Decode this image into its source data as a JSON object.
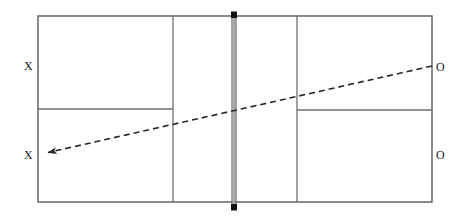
{
  "diagram": {
    "type": "tennis-court-overhead",
    "background_color": "#ffffff",
    "line_color": "#6e6e6e",
    "net_color": "#9a9a9a",
    "net_post_color": "#1a1a1a",
    "shot_color": "#262626",
    "label_color": "#1a1a1a"
  },
  "court": {
    "outer_boundary": {
      "x": 38,
      "y": 16,
      "width": 394,
      "height": 186
    },
    "service_line_left_x": 173,
    "service_line_right_x": 297,
    "center_service_line_left": {
      "x1": 38,
      "y1": 109,
      "x2": 173,
      "y2": 109
    },
    "center_service_line_right": {
      "x1": 297,
      "y1": 110,
      "x2": 432,
      "y2": 110
    },
    "net": {
      "x": 234,
      "y_top": 12,
      "y_bottom": 210,
      "width": 5
    },
    "net_post_top": {
      "x": 234,
      "y": 15
    },
    "net_post_bottom": {
      "x": 234,
      "y": 207
    }
  },
  "shot": {
    "label": "shot-path",
    "style": "dashed",
    "dash_pattern": "6 4",
    "stroke_width": 1.6,
    "from": {
      "x": 432,
      "y": 66
    },
    "to": {
      "x": 45,
      "y": 153
    },
    "arrowhead_at": "to"
  },
  "labels": {
    "player_x_top": {
      "text": "X",
      "x": 28,
      "y": 66
    },
    "player_x_bottom": {
      "text": "X",
      "x": 28,
      "y": 155
    },
    "player_o_top": {
      "text": "O",
      "x": 440,
      "y": 67
    },
    "player_o_bottom": {
      "text": "O",
      "x": 440,
      "y": 155
    }
  }
}
